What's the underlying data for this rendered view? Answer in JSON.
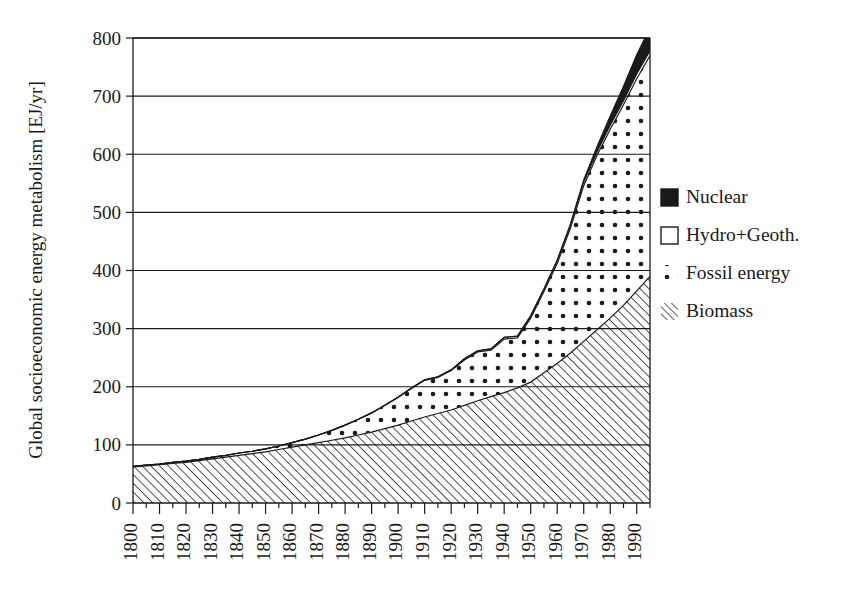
{
  "chart_data": {
    "type": "area",
    "subtype": "stacked-area",
    "title": "",
    "xlabel": "",
    "ylabel": "Global socioeconomic energy metabolism [EJ/yr]",
    "xlim": [
      1800,
      1995
    ],
    "ylim": [
      0,
      800
    ],
    "ytick_step": 100,
    "yticks": [
      0,
      100,
      200,
      300,
      400,
      500,
      600,
      700,
      800
    ],
    "xticks": [
      1800,
      1810,
      1820,
      1830,
      1840,
      1850,
      1860,
      1870,
      1880,
      1890,
      1900,
      1910,
      1920,
      1930,
      1940,
      1950,
      1960,
      1970,
      1980,
      1990
    ],
    "xtick_labels": [
      "1800",
      "1810",
      "1820",
      "1830",
      "1840",
      "1850",
      "1860",
      "1870",
      "1880",
      "1890",
      "1900",
      "1910",
      "1920",
      "1930",
      "1940",
      "1950",
      "1960",
      "1970",
      "1980",
      "1990"
    ],
    "xtick_minor_step": 5,
    "xtick_rotation": 90,
    "grid": "horizontal",
    "legend_position": "right",
    "units": "EJ/yr",
    "x": [
      1800,
      1805,
      1810,
      1815,
      1820,
      1825,
      1830,
      1835,
      1840,
      1845,
      1850,
      1855,
      1860,
      1865,
      1870,
      1875,
      1880,
      1885,
      1890,
      1895,
      1900,
      1905,
      1910,
      1915,
      1920,
      1925,
      1930,
      1935,
      1940,
      1945,
      1950,
      1955,
      1960,
      1965,
      1970,
      1975,
      1980,
      1985,
      1990,
      1995
    ],
    "series": [
      {
        "name": "Biomass",
        "pattern": "diagonal-hatch",
        "stack_order": 1,
        "values": [
          62,
          64,
          66,
          68,
          70,
          73,
          76,
          79,
          82,
          85,
          88,
          92,
          96,
          100,
          104,
          108,
          112,
          117,
          122,
          128,
          134,
          141,
          148,
          154,
          160,
          168,
          176,
          183,
          190,
          198,
          208,
          224,
          240,
          258,
          278,
          298,
          318,
          340,
          365,
          390
        ]
      },
      {
        "name": "Fossil energy",
        "pattern": "dots",
        "stack_order": 2,
        "values": [
          1,
          1,
          1,
          2,
          2,
          2,
          3,
          3,
          4,
          4,
          5,
          6,
          8,
          10,
          13,
          17,
          22,
          27,
          33,
          40,
          48,
          56,
          63,
          62,
          68,
          78,
          84,
          80,
          92,
          86,
          110,
          140,
          172,
          215,
          268,
          300,
          325,
          345,
          365,
          380
        ]
      },
      {
        "name": "Hydro+Geoth.",
        "pattern": "white",
        "stack_order": 3,
        "values": [
          0,
          0,
          0,
          0,
          0,
          0,
          0,
          0,
          0,
          0,
          0,
          0,
          0,
          0,
          0,
          0,
          0,
          0,
          0,
          0,
          0,
          1,
          1,
          1,
          1,
          2,
          2,
          2,
          3,
          3,
          4,
          4,
          5,
          5,
          6,
          6,
          7,
          7,
          8,
          8
        ]
      },
      {
        "name": "Nuclear",
        "pattern": "solid-black",
        "stack_order": 4,
        "values": [
          0,
          0,
          0,
          0,
          0,
          0,
          0,
          0,
          0,
          0,
          0,
          0,
          0,
          0,
          0,
          0,
          0,
          0,
          0,
          0,
          0,
          0,
          0,
          0,
          0,
          0,
          0,
          0,
          0,
          0,
          0,
          0,
          1,
          2,
          4,
          9,
          16,
          25,
          33,
          40
        ]
      }
    ],
    "totals": [
      63,
      65,
      67,
      70,
      72,
      75,
      79,
      82,
      86,
      89,
      93,
      98,
      104,
      110,
      117,
      125,
      134,
      144,
      155,
      168,
      182,
      198,
      212,
      217,
      229,
      248,
      262,
      265,
      285,
      287,
      322,
      368,
      418,
      480,
      556,
      613,
      666,
      717,
      771,
      818
    ]
  },
  "legend": {
    "items": [
      {
        "label": "Nuclear",
        "swatch": "solid-black-square",
        "color": "#1a1a1a"
      },
      {
        "label": "Hydro+Geoth.",
        "swatch": "outline-square",
        "color": "#ffffff"
      },
      {
        "label": "Fossil energy",
        "swatch": "dotted-square",
        "color": "#1a1a1a"
      },
      {
        "label": "Biomass",
        "swatch": "hatched-square",
        "color": "#1a1a1a"
      }
    ]
  },
  "axes": {
    "y_title": "Global socioeconomic energy metabolism [EJ/yr]",
    "y_labels": [
      "800",
      "700",
      "600",
      "500",
      "400",
      "300",
      "200",
      "100",
      "0"
    ],
    "x_labels": [
      "1800",
      "1810",
      "1820",
      "1830",
      "1840",
      "1850",
      "1860",
      "1870",
      "1880",
      "1890",
      "1900",
      "1910",
      "1920",
      "1930",
      "1940",
      "1950",
      "1960",
      "1970",
      "1980",
      "1990"
    ]
  },
  "style": {
    "ink": "#1a1a1a",
    "background": "#ffffff"
  }
}
